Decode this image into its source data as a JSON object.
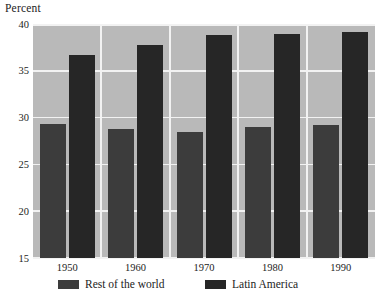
{
  "chart_data": {
    "type": "bar",
    "title": "",
    "subtitle": "",
    "xlabel": "",
    "ylabel": "Percent",
    "categories": [
      "1950",
      "1960",
      "1970",
      "1980",
      "1990"
    ],
    "series": [
      {
        "name": "Rest of the world",
        "color": "#3c3c3c",
        "values": [
          29.3,
          28.8,
          28.5,
          29.0,
          29.2
        ]
      },
      {
        "name": "Latin America",
        "color": "#262626",
        "values": [
          36.7,
          37.8,
          38.8,
          38.9,
          39.2
        ]
      }
    ],
    "ylim": [
      15,
      40
    ],
    "yticks": [
      "15",
      "20",
      "25",
      "30",
      "35",
      "40"
    ],
    "ytick_values": [
      15,
      20,
      25,
      30,
      35,
      40
    ],
    "grid": true,
    "grid_color": "#f2f2f2",
    "plot_background": "#b9b9b9",
    "legend_position": "bottom"
  },
  "legend": {
    "items": [
      {
        "label": "Rest of the world"
      },
      {
        "label": "Latin America"
      }
    ]
  }
}
